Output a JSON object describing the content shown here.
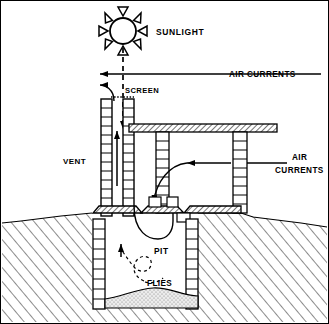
{
  "figure": {
    "background_color": "#ffffff",
    "line_color": "#000000",
    "border": true,
    "width": 329,
    "height": 324
  },
  "labels": {
    "sunlight": "SUNLIGHT",
    "air_currents_top": "AIR CURRENTS",
    "screen": "SCREEN",
    "vent": "VENT",
    "air_currents_right_line1": "AIR",
    "air_currents_right_line2": "CURRENTS",
    "pit": "PIT",
    "flies": "FLIES"
  },
  "elements": {
    "sun": {
      "name": "sun-icon",
      "rays": 8,
      "center_x": 122,
      "center_y": 30,
      "radius": 13
    },
    "sun_ray_down": {
      "name": "sunlight-ray",
      "style": "dashed",
      "from_y": 45,
      "to_y": 128
    },
    "air_arrow_top": {
      "name": "air-current-arrow-top",
      "y": 73,
      "from_x": 320,
      "to_x": 96
    },
    "air_arrow_vent": {
      "name": "vent-exhaust-arrow",
      "y": 84,
      "to_x": 96
    },
    "screen_mesh": {
      "name": "screen-mesh",
      "style": "dotted",
      "y": 96
    },
    "vent_pipe": {
      "name": "vent-pipe",
      "x": 100,
      "width": 30,
      "top_y": 98,
      "bottom_y": 215
    },
    "roof_slab": {
      "name": "roof-slab",
      "hatch": "diagonal",
      "x": 128,
      "y": 123,
      "width": 148,
      "height": 8
    },
    "superstructure_wall_left": {
      "name": "superstructure-wall-left",
      "x": 155,
      "width": 13
    },
    "superstructure_wall_right": {
      "name": "superstructure-wall-right",
      "x": 232,
      "width": 14
    },
    "floor_slab": {
      "name": "floor-slab",
      "hatch": "diagonal",
      "y": 212
    },
    "squat_hole": {
      "name": "squat-hole",
      "x": 148,
      "width": 28
    },
    "pit_wall_left": {
      "name": "pit-wall-left",
      "x": 92,
      "width": 12
    },
    "pit_wall_right": {
      "name": "pit-wall-right",
      "x": 185,
      "width": 12
    },
    "ground_line": {
      "name": "ground-line",
      "y": 215
    },
    "soil_hatch": {
      "name": "soil-hatching",
      "style": "diagonal-lines"
    },
    "sludge": {
      "name": "sludge-pile",
      "fill": "stipple"
    },
    "fly_path": {
      "name": "fly-path",
      "style": "dashed-loop"
    },
    "updraft_arrow": {
      "name": "updraft-arrow",
      "x": 118,
      "from_y": 275,
      "to_y": 245
    },
    "air_inflow_arrow": {
      "name": "air-inflow-arrow",
      "curved": true
    }
  },
  "colors": {
    "stroke": "#000000",
    "fill_white": "#ffffff",
    "sludge_fill": "#e8e8e8",
    "hatch": "#000000"
  }
}
